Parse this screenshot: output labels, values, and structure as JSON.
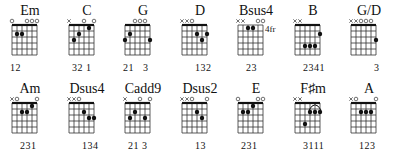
{
  "chord_chart": {
    "rows": [
      [
        {
          "name": "Em",
          "strings": [
            "o",
            "",
            "",
            "o",
            "o",
            "o"
          ],
          "dots": [
            [
              2,
              2
            ],
            [
              3,
              2
            ]
          ],
          "fingering": "12",
          "fingering_offset": [
            0,
            1
          ]
        },
        {
          "name": "C",
          "strings": [
            "x",
            "",
            "",
            "o",
            "",
            "o"
          ],
          "dots": [
            [
              2,
              3
            ],
            [
              3,
              2
            ],
            [
              5,
              1
            ]
          ],
          "fingering": "32 1",
          "fingering_offset": [
            1
          ]
        },
        {
          "name": "G",
          "strings": [
            "",
            "",
            "o",
            "o",
            "o",
            ""
          ],
          "dots": [
            [
              1,
              3
            ],
            [
              2,
              2
            ],
            [
              6,
              3
            ]
          ],
          "fingering": "21   3",
          "fingering_offset": [
            0
          ]
        },
        {
          "name": "D",
          "strings": [
            "x",
            "x",
            "o",
            "",
            "",
            ""
          ],
          "dots": [
            [
              4,
              2
            ],
            [
              5,
              3
            ],
            [
              6,
              2
            ]
          ],
          "fingering": "132",
          "fingering_offset": [
            3
          ]
        },
        {
          "name": "Bsus4",
          "strings": [
            "x",
            "x",
            "",
            "",
            "o",
            "o"
          ],
          "dots": [
            [
              3,
              1
            ],
            [
              4,
              1
            ]
          ],
          "fingering": "23",
          "fingering_offset": [
            2
          ],
          "fret_label": "4fr"
        },
        {
          "name": "B",
          "strings": [
            "x",
            "x",
            "",
            "",
            "",
            ""
          ],
          "dots": [
            [
              3,
              4
            ],
            [
              4,
              4
            ],
            [
              5,
              4
            ],
            [
              6,
              2
            ]
          ],
          "fingering": "2341",
          "fingering_offset": [
            2
          ],
          "barre_top": true
        },
        {
          "name": "G/D",
          "strings": [
            "x",
            "x",
            "o",
            "o",
            "o",
            ""
          ],
          "dots": [
            [
              6,
              3
            ]
          ],
          "fingering": "3",
          "fingering_offset": [
            5
          ]
        }
      ],
      [
        {
          "name": "Am",
          "strings": [
            "x",
            "o",
            "",
            "",
            "",
            "o"
          ],
          "dots": [
            [
              3,
              2
            ],
            [
              4,
              2
            ],
            [
              5,
              1
            ]
          ],
          "fingering": "231",
          "fingering_offset": [
            2
          ]
        },
        {
          "name": "Dsus4",
          "strings": [
            "x",
            "x",
            "o",
            "",
            "",
            ""
          ],
          "dots": [
            [
              4,
              2
            ],
            [
              5,
              3
            ],
            [
              6,
              3
            ]
          ],
          "fingering": "134",
          "fingering_offset": [
            3
          ]
        },
        {
          "name": "Cadd9",
          "strings": [
            "x",
            "",
            "",
            "o",
            "",
            "o"
          ],
          "dots": [
            [
              2,
              3
            ],
            [
              3,
              2
            ],
            [
              5,
              3
            ]
          ],
          "fingering": "21 3",
          "fingering_offset": [
            1
          ]
        },
        {
          "name": "Dsus2",
          "strings": [
            "x",
            "x",
            "o",
            "",
            "",
            "o"
          ],
          "dots": [
            [
              4,
              2
            ],
            [
              5,
              3
            ]
          ],
          "fingering": "13",
          "fingering_offset": [
            3
          ]
        },
        {
          "name": "E",
          "strings": [
            "o",
            "",
            "",
            "",
            "o",
            "o"
          ],
          "dots": [
            [
              2,
              2
            ],
            [
              3,
              2
            ],
            [
              4,
              1
            ]
          ],
          "fingering": "231",
          "fingering_offset": [
            1
          ]
        },
        {
          "name": "F♯m",
          "strings": [
            "x",
            "x",
            "",
            "",
            "",
            ""
          ],
          "dots": [
            [
              3,
              4
            ],
            [
              4,
              2
            ],
            [
              5,
              2
            ],
            [
              6,
              2
            ]
          ],
          "fingering": "3111",
          "fingering_offset": [
            2
          ],
          "barre_arc": true
        },
        {
          "name": "A",
          "strings": [
            "x",
            "o",
            "",
            "",
            "",
            "o"
          ],
          "dots": [
            [
              3,
              2
            ],
            [
              4,
              2
            ],
            [
              5,
              2
            ]
          ],
          "fingering": "123",
          "fingering_offset": [
            2
          ]
        }
      ]
    ]
  }
}
